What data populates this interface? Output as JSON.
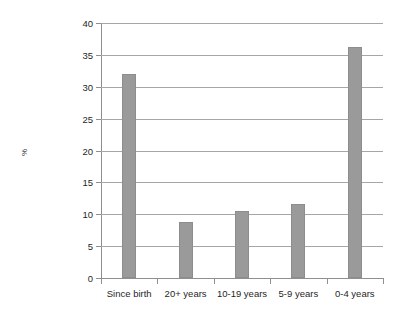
{
  "chart_data": {
    "type": "bar",
    "title": "",
    "xlabel": "",
    "ylabel": "%",
    "categories": [
      "Since birth",
      "20+ years",
      "10-19 years",
      "5-9 years",
      "0-4 years"
    ],
    "values": [
      32.0,
      8.8,
      10.5,
      11.6,
      36.3
    ],
    "ylim": [
      0,
      40
    ],
    "ytick_labels": [
      "0",
      "5",
      "10",
      "15",
      "20",
      "25",
      "30",
      "35",
      "40"
    ],
    "ytick_values": [
      0,
      5,
      10,
      15,
      20,
      25,
      30,
      35,
      40
    ],
    "grid": true,
    "legend": "none",
    "series_name": "",
    "bar_color": "#9a9a9a",
    "grid_color": "#a6a6a6",
    "axis_color": "#8f8f8f",
    "background_color": "#ffffff"
  }
}
